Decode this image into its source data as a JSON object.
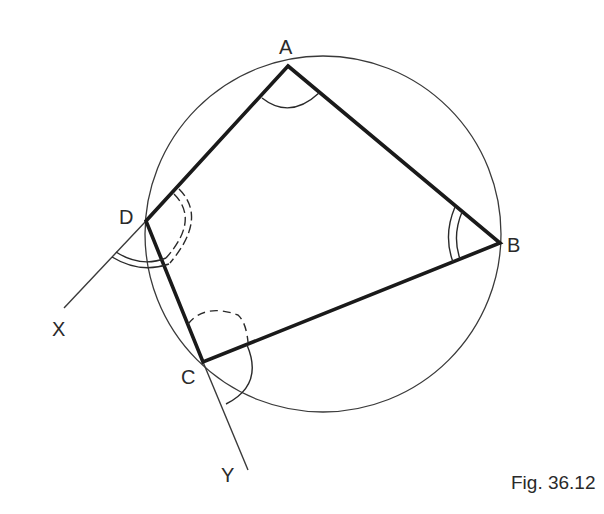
{
  "figure": {
    "caption": "Fig. 36.12",
    "colors": {
      "ink": "#1a1a1a",
      "thin": "#3a3a3a",
      "background": "#ffffff"
    }
  },
  "circle": {
    "cx": 323,
    "cy": 234,
    "r": 178
  },
  "vertices": {
    "A": {
      "label": "A",
      "x": 288,
      "y": 66,
      "lx": 279,
      "ly": 54
    },
    "B": {
      "label": "B",
      "x": 500,
      "y": 243,
      "lx": 507,
      "ly": 252
    },
    "C": {
      "label": "C",
      "x": 203,
      "y": 362,
      "lx": 181,
      "ly": 384
    },
    "D": {
      "label": "D",
      "x": 146,
      "y": 221,
      "lx": 119,
      "ly": 224
    }
  },
  "extensions": {
    "X": {
      "label": "X",
      "x": 64,
      "y": 308,
      "lx": 52,
      "ly": 336
    },
    "Y": {
      "label": "Y",
      "x": 248,
      "y": 470,
      "lx": 221,
      "ly": 482
    }
  },
  "angle_marks": [
    {
      "at": "A",
      "style": "single"
    },
    {
      "at": "B",
      "style": "double"
    },
    {
      "at": "D",
      "style": "double-dashed",
      "note": "interior angle ADC"
    },
    {
      "at": "D",
      "style": "double",
      "note": "exterior angle ADX"
    },
    {
      "at": "C",
      "style": "single-dashed",
      "note": "interior angle DCB"
    },
    {
      "at": "C",
      "style": "single",
      "note": "exterior angle BCY"
    }
  ]
}
